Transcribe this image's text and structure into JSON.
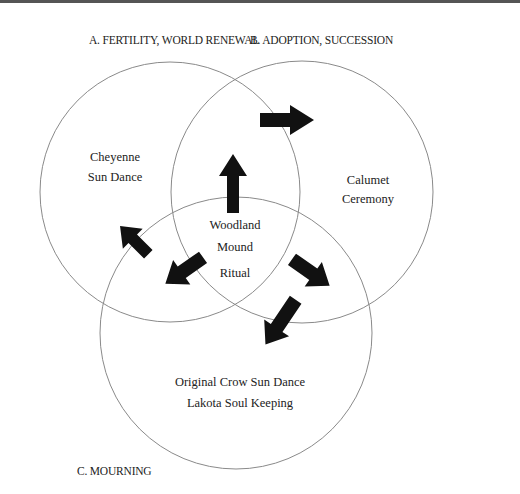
{
  "diagram": {
    "type": "venn",
    "sets": [
      {
        "id": "A",
        "label": "A. FERTILITY, WORLD RENEWAL"
      },
      {
        "id": "B",
        "label": "B. ADOPTION, SUCCESSION"
      },
      {
        "id": "C",
        "label": "C. MOURNING"
      }
    ],
    "regions": {
      "a_only": [
        "Cheyenne",
        "Sun Dance"
      ],
      "b_only": [
        "Calumet",
        "Ceremony"
      ],
      "center": [
        "Woodland",
        "Mound",
        "Ritual"
      ],
      "c_only": [
        "Original Crow Sun Dance",
        "Lakota Soul Keeping"
      ]
    },
    "arrows": [
      {
        "from": "center",
        "direction": "up"
      },
      {
        "from": "A∩B",
        "direction": "right",
        "to": "B"
      },
      {
        "from": "A∩C",
        "direction": "up-left",
        "to": "A"
      },
      {
        "from": "center",
        "direction": "down-left"
      },
      {
        "from": "center",
        "direction": "down-right"
      },
      {
        "from": "B∩C",
        "direction": "down-left",
        "to": "C"
      }
    ],
    "colors": {
      "circle_stroke": "#8a8a8a",
      "arrow_fill": "#111111",
      "text": "#222222"
    }
  }
}
